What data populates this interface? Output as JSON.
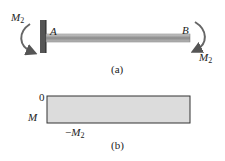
{
  "figure_a": {
    "label": "(a)",
    "left_moment": {
      "symbol": "M",
      "subscript": "2"
    },
    "right_moment": {
      "symbol": "M",
      "subscript": "2"
    },
    "point_a": "A",
    "point_b": "B"
  },
  "figure_b": {
    "label": "(b)",
    "zero_label": "0",
    "axis_label": "M",
    "bottom_label": {
      "prefix": "−",
      "symbol": "M",
      "subscript": "2"
    }
  },
  "colors": {
    "beam": "#a8a8a8",
    "diagram_fill": "#dcdcdc",
    "outline": "#333333"
  }
}
